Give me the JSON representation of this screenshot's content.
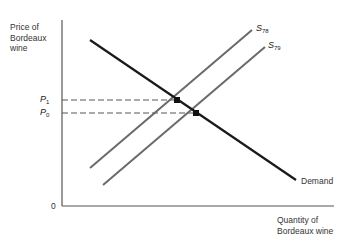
{
  "diagram": {
    "type": "supply-demand",
    "y_axis_label": [
      "Price of",
      "Bordeaux",
      "wine"
    ],
    "x_axis_label": [
      "Quantity of",
      "Bordeaux wine"
    ],
    "origin_label": "0",
    "price_labels": {
      "p1": {
        "letter": "P",
        "sub": "1"
      },
      "p0": {
        "letter": "P",
        "sub": "0"
      }
    },
    "curves": {
      "demand": {
        "label": "Demand",
        "color": "#1a1a1a"
      },
      "s78": {
        "letter": "S",
        "sub": "78",
        "color": "#666666"
      },
      "s79": {
        "letter": "S",
        "sub": "79",
        "color": "#666666"
      }
    },
    "equilibria": [
      {
        "name": "E1",
        "price": "P1",
        "supply": "S78"
      },
      {
        "name": "E0",
        "price": "P0",
        "supply": "S79"
      }
    ]
  }
}
